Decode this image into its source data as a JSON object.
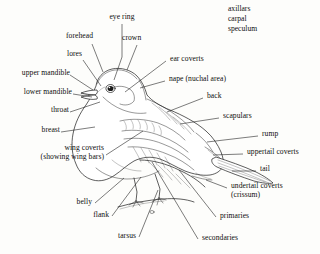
{
  "figure": {
    "kind": "bird-topography-line-drawing",
    "background_color": "#fdfdfb",
    "ink_color": "#1a1a1a"
  },
  "free_text_block": {
    "name": "unlabeled-terms-block",
    "lines": [
      "axillars",
      "carpal",
      "speculum"
    ]
  },
  "labels": [
    {
      "id": "eye-ring",
      "text": "eye ring"
    },
    {
      "id": "forehead",
      "text": "forehead"
    },
    {
      "id": "crown",
      "text": "crown"
    },
    {
      "id": "lores",
      "text": "lores"
    },
    {
      "id": "ear-coverts",
      "text": "ear coverts"
    },
    {
      "id": "upper-mandible",
      "text": "upper mandible"
    },
    {
      "id": "nape",
      "text": "nape (nuchal area)"
    },
    {
      "id": "lower-mandible",
      "text": "lower mandible"
    },
    {
      "id": "back",
      "text": "back"
    },
    {
      "id": "throat",
      "text": "throat"
    },
    {
      "id": "scapulars",
      "text": "scapulars"
    },
    {
      "id": "breast",
      "text": "breast"
    },
    {
      "id": "rump",
      "text": "rump"
    },
    {
      "id": "wing-coverts-1",
      "text": "wing coverts"
    },
    {
      "id": "wing-coverts-2",
      "text": "(showing wing bars)"
    },
    {
      "id": "uppertail-coverts",
      "text": "uppertail coverts"
    },
    {
      "id": "tail",
      "text": "tail"
    },
    {
      "id": "undertail-coverts-1",
      "text": "undertail coverts"
    },
    {
      "id": "undertail-coverts-2",
      "text": "(crissum)"
    },
    {
      "id": "belly",
      "text": "belly"
    },
    {
      "id": "flank",
      "text": "flank"
    },
    {
      "id": "primaries",
      "text": "primaries"
    },
    {
      "id": "tarsus",
      "text": "tarsus"
    },
    {
      "id": "secondaries",
      "text": "secondaries"
    }
  ]
}
